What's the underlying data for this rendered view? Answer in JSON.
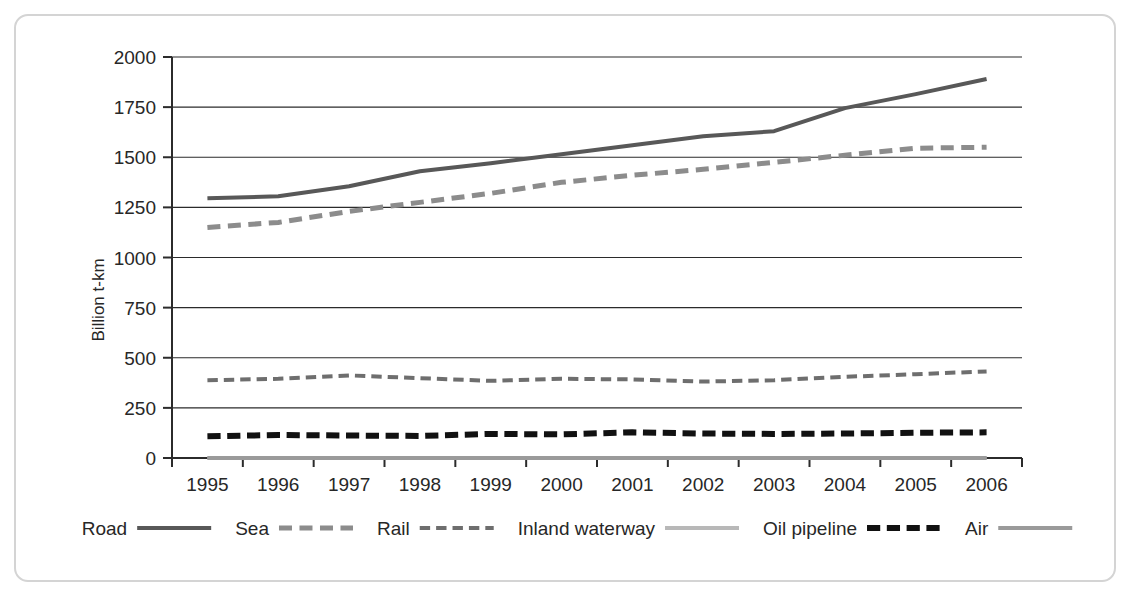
{
  "chart_data": {
    "type": "line",
    "title": "",
    "xlabel": "",
    "ylabel": "Billion t-km",
    "x": [
      1995,
      1996,
      1997,
      1998,
      1999,
      2000,
      2001,
      2002,
      2003,
      2004,
      2005,
      2006
    ],
    "categories": [
      "1995",
      "1996",
      "1997",
      "1998",
      "1999",
      "2000",
      "2001",
      "2002",
      "2003",
      "2004",
      "2005",
      "2006"
    ],
    "ylim": [
      0,
      2000
    ],
    "yticks": [
      0,
      250,
      500,
      750,
      1000,
      1250,
      1500,
      1750,
      2000
    ],
    "ytick_labels": [
      "0",
      "250",
      "500",
      "750",
      "1000",
      "1250",
      "1500",
      "1750",
      "2000"
    ],
    "grid": "horizontal",
    "legend_position": "bottom",
    "series": [
      {
        "name": "Road",
        "style": "solid",
        "color": "#585858",
        "width": 4,
        "values": [
          1295,
          1305,
          1355,
          1430,
          1470,
          1515,
          1560,
          1605,
          1630,
          1745,
          1815,
          1890
        ]
      },
      {
        "name": "Sea",
        "style": "dashed",
        "color": "#8c8c8c",
        "width": 5,
        "values": [
          1150,
          1175,
          1230,
          1275,
          1320,
          1375,
          1410,
          1440,
          1475,
          1510,
          1545,
          1550
        ]
      },
      {
        "name": "Rail",
        "style": "dashed",
        "color": "#6e6e6e",
        "width": 4,
        "values": [
          388,
          395,
          412,
          398,
          385,
          395,
          392,
          381,
          388,
          405,
          418,
          432
        ]
      },
      {
        "name": "Inland waterway",
        "style": "solid",
        "color": "#b8b8b8",
        "width": 4,
        "values": [
          0,
          0,
          0,
          0,
          0,
          0,
          0,
          0,
          0,
          0,
          0,
          0
        ]
      },
      {
        "name": "Oil pipeline",
        "style": "dashed-bold",
        "color": "#111111",
        "width": 6,
        "values": [
          108,
          115,
          112,
          110,
          120,
          118,
          128,
          122,
          120,
          122,
          126,
          128
        ]
      },
      {
        "name": "Air",
        "style": "solid",
        "color": "#9a9a9a",
        "width": 4,
        "values": [
          0,
          0,
          0,
          0,
          0,
          0,
          0,
          0,
          0,
          0,
          0,
          0
        ]
      }
    ]
  },
  "legend": {
    "entries": [
      {
        "label": "Road",
        "sample": "solid-dark"
      },
      {
        "label": "Sea",
        "sample": "dashed-gray"
      },
      {
        "label": "Rail",
        "sample": "dashed-dark"
      },
      {
        "label": "Inland waterway",
        "sample": "solid-light"
      },
      {
        "label": "Oil pipeline",
        "sample": "dashed-bold-black"
      },
      {
        "label": "Air",
        "sample": "solid-gray"
      }
    ]
  }
}
